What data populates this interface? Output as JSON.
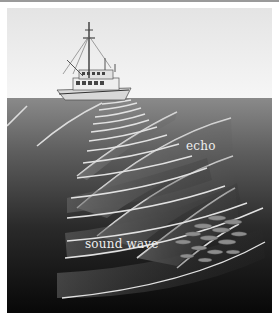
{
  "figure": {
    "labels": {
      "echo": "echo",
      "sound_wave": "sound wave"
    },
    "elements": {
      "boat": "fishing-boat",
      "fish_school": "fish-school",
      "emitted_waves": "sound-wave-arcs",
      "reflected_waves": "echo-arcs"
    },
    "colors": {
      "sky_top": "#e6e6e6",
      "sky_bottom": "#f5f5f5",
      "water_surface": "#808080",
      "water_deep": "#0a0a0a",
      "wave_line": "#e0e0e0"
    }
  }
}
